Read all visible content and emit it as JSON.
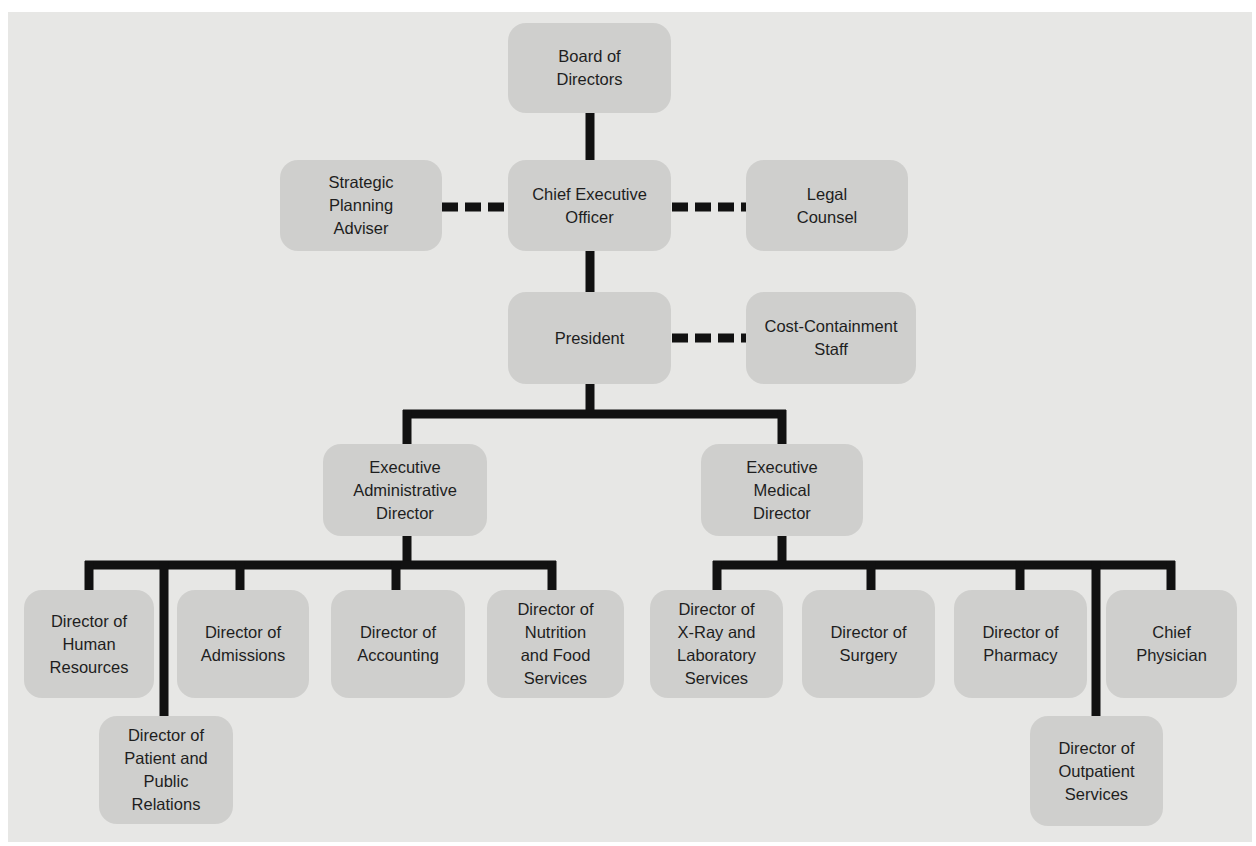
{
  "chart": {
    "title": "",
    "colors": {
      "background": "#e7e7e5",
      "node_fill": "#cfcfcd",
      "line": "#111111",
      "text": "#1e1e1e"
    },
    "nodes": {
      "board": "Board of\nDirectors",
      "ceo": "Chief Executive\nOfficer",
      "strategic": "Strategic\nPlanning\nAdviser",
      "legal": "Legal\nCounsel",
      "president": "President",
      "cost": "Cost-Containment\nStaff",
      "exec_admin": "Executive\nAdministrative\nDirector",
      "exec_medical": "Executive\nMedical\nDirector",
      "hr": "Director of\nHuman\nResources",
      "patient_pr": "Director of\nPatient and\nPublic\nRelations",
      "admissions": "Director of\nAdmissions",
      "accounting": "Director of\nAccounting",
      "nutrition": "Director of\nNutrition\nand Food\nServices",
      "xray": "Director of\nX-Ray and\nLaboratory\nServices",
      "surgery": "Director of\nSurgery",
      "pharmacy": "Director of\nPharmacy",
      "outpatient": "Director of\nOutpatient\nServices",
      "chief_physician": "Chief\nPhysician"
    },
    "relationships": {
      "line_authority": [
        [
          "board",
          "ceo"
        ],
        [
          "ceo",
          "president"
        ],
        [
          "president",
          "exec_admin"
        ],
        [
          "president",
          "exec_medical"
        ],
        [
          "exec_admin",
          "hr"
        ],
        [
          "exec_admin",
          "patient_pr"
        ],
        [
          "exec_admin",
          "admissions"
        ],
        [
          "exec_admin",
          "accounting"
        ],
        [
          "exec_admin",
          "nutrition"
        ],
        [
          "exec_medical",
          "xray"
        ],
        [
          "exec_medical",
          "surgery"
        ],
        [
          "exec_medical",
          "pharmacy"
        ],
        [
          "exec_medical",
          "outpatient"
        ],
        [
          "exec_medical",
          "chief_physician"
        ]
      ],
      "staff_advisory_dashed": [
        [
          "ceo",
          "strategic"
        ],
        [
          "ceo",
          "legal"
        ],
        [
          "president",
          "cost"
        ]
      ]
    }
  }
}
